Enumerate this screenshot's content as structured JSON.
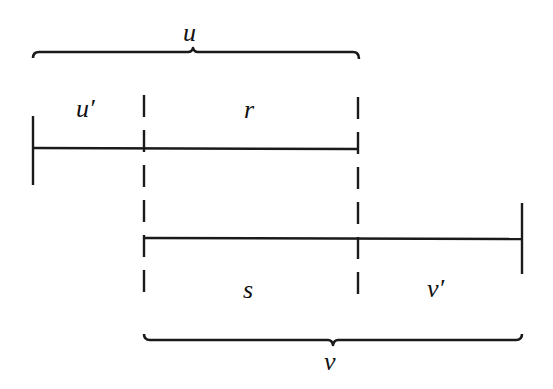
{
  "diagram": {
    "type": "interval-overlap",
    "labels": {
      "top_brace": "u",
      "u_prime": "u′",
      "r": "r",
      "s": "s",
      "v_prime": "v′",
      "bottom_brace": "v"
    },
    "segments": [
      {
        "name": "u",
        "parts": [
          "u′",
          "r"
        ],
        "description": "upper interval"
      },
      {
        "name": "v",
        "parts": [
          "s",
          "v′"
        ],
        "description": "lower interval"
      }
    ],
    "colors": {
      "line": "#1a1a1a",
      "background": "#ffffff"
    }
  }
}
